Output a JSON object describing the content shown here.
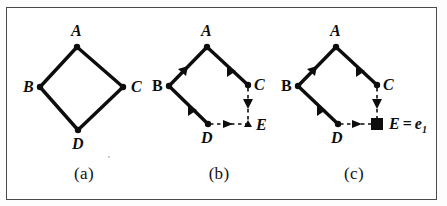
{
  "figure": {
    "caption_a": "(a)",
    "caption_b": "(b)",
    "caption_c": "(c)",
    "stroke_color": "#0d0d0d",
    "frame_color": "#4a4a4a",
    "background": "#ffffff"
  },
  "panel_a": {
    "caption": "(a)",
    "labels": {
      "A": "A",
      "B": "B",
      "C": "C",
      "D": "D"
    },
    "nodes": [
      {
        "id": "A",
        "x": 76,
        "y": 45
      },
      {
        "id": "B",
        "x": 39,
        "y": 85
      },
      {
        "id": "C",
        "x": 122,
        "y": 85
      },
      {
        "id": "D",
        "x": 77,
        "y": 128
      }
    ],
    "edges": [
      {
        "from": "A",
        "to": "B",
        "style": "solid",
        "directed": false
      },
      {
        "from": "A",
        "to": "C",
        "style": "solid",
        "directed": false
      },
      {
        "from": "B",
        "to": "D",
        "style": "solid",
        "directed": false
      },
      {
        "from": "C",
        "to": "D",
        "style": "solid",
        "directed": false
      }
    ]
  },
  "panel_b": {
    "caption": "(b)",
    "labels": {
      "A": "A",
      "B": "B",
      "C": "C",
      "D": "D",
      "E": "E"
    },
    "nodes": [
      {
        "id": "A",
        "x": 205,
        "y": 45
      },
      {
        "id": "B",
        "x": 167,
        "y": 84
      },
      {
        "id": "C",
        "x": 246,
        "y": 83
      },
      {
        "id": "D",
        "x": 206,
        "y": 122
      },
      {
        "id": "E",
        "x": 246,
        "y": 122
      }
    ],
    "edges": [
      {
        "from": "A",
        "to": "B",
        "style": "solid",
        "directed": true
      },
      {
        "from": "A",
        "to": "C",
        "style": "solid",
        "directed": true
      },
      {
        "from": "B",
        "to": "D",
        "style": "solid",
        "directed": true
      },
      {
        "from": "C",
        "to": "E",
        "style": "dashed",
        "directed": true
      },
      {
        "from": "D",
        "to": "E",
        "style": "dashed",
        "directed": true
      }
    ]
  },
  "panel_c": {
    "caption": "(c)",
    "labels": {
      "A": "A",
      "B": "B",
      "C": "C",
      "D": "D"
    },
    "evidence_label": {
      "variable": "E",
      "equals": "=",
      "value": "e",
      "subscript": "1"
    },
    "nodes": [
      {
        "id": "A",
        "x": 334,
        "y": 45
      },
      {
        "id": "B",
        "x": 297,
        "y": 84
      },
      {
        "id": "C",
        "x": 375,
        "y": 83
      },
      {
        "id": "D",
        "x": 337,
        "y": 122
      },
      {
        "id": "E",
        "x": 374,
        "y": 122,
        "shape": "filled-square",
        "observed": true
      }
    ],
    "edges": [
      {
        "from": "A",
        "to": "B",
        "style": "solid",
        "directed": true
      },
      {
        "from": "A",
        "to": "C",
        "style": "solid",
        "directed": true
      },
      {
        "from": "B",
        "to": "D",
        "style": "solid",
        "directed": true
      },
      {
        "from": "C",
        "to": "E",
        "style": "dashed",
        "directed": true
      },
      {
        "from": "D",
        "to": "E",
        "style": "dashed",
        "directed": true
      }
    ]
  }
}
